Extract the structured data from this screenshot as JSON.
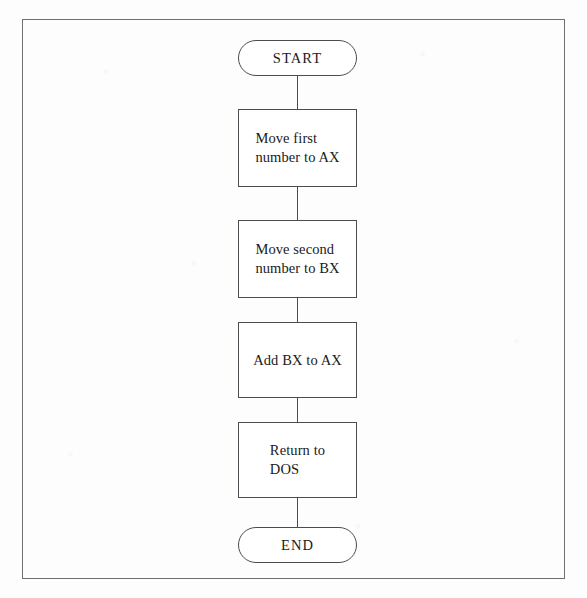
{
  "diagram": {
    "border_color": "#6d6f74",
    "line_color": "#4a4c52",
    "background": "#fdfdfd",
    "nodes": [
      {
        "id": "start",
        "type": "terminator",
        "label": "START"
      },
      {
        "id": "step1",
        "type": "process",
        "label": "Move first\nnumber to AX"
      },
      {
        "id": "step2",
        "type": "process",
        "label": "Move second\nnumber to BX"
      },
      {
        "id": "step3",
        "type": "process",
        "label": "Add BX to AX"
      },
      {
        "id": "step4",
        "type": "process",
        "label": "Return to\nDOS"
      },
      {
        "id": "end",
        "type": "terminator",
        "label": "END"
      }
    ],
    "connectors": [
      {
        "from": "start",
        "to": "step1"
      },
      {
        "from": "step1",
        "to": "step2"
      },
      {
        "from": "step2",
        "to": "step3"
      },
      {
        "from": "step3",
        "to": "step4"
      },
      {
        "from": "step4",
        "to": "end"
      }
    ]
  }
}
